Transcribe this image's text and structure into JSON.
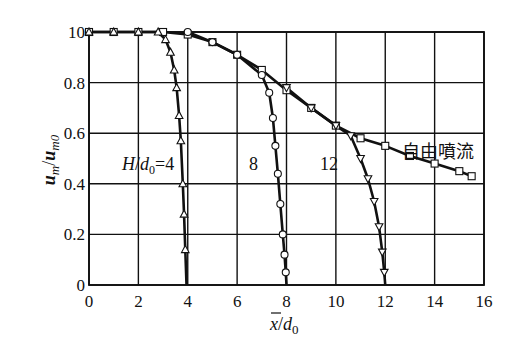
{
  "chart_data": {
    "type": "line",
    "title": "",
    "xlabel": "x̄/d0",
    "ylabel": "um/um0",
    "xlim": [
      0,
      16
    ],
    "ylim": [
      0,
      1.0
    ],
    "grid": true,
    "x_ticks": [
      "0",
      "2",
      "4",
      "6",
      "8",
      "10",
      "12",
      "14",
      "16"
    ],
    "y_ticks": [
      "0",
      "0.2",
      "0.4",
      "0.6",
      "0.8",
      "10"
    ],
    "series": [
      {
        "name": "自由噴流",
        "marker": "square",
        "x": [
          0,
          1,
          2,
          3,
          4,
          5,
          6,
          7,
          8,
          9,
          10,
          11,
          12,
          13,
          14,
          15,
          15.5
        ],
        "y": [
          1.0,
          1.0,
          1.0,
          1.0,
          0.99,
          0.96,
          0.91,
          0.85,
          0.77,
          0.7,
          0.63,
          0.58,
          0.55,
          0.51,
          0.48,
          0.45,
          0.43
        ]
      },
      {
        "name": "H/d0=4",
        "marker": "triangle-up",
        "x": [
          0,
          1,
          2,
          2.8,
          3.1,
          3.3,
          3.45,
          3.55,
          3.65,
          3.72,
          3.8,
          3.85,
          3.9,
          3.95
        ],
        "y": [
          1.0,
          1.0,
          1.0,
          1.0,
          0.97,
          0.92,
          0.85,
          0.78,
          0.67,
          0.57,
          0.4,
          0.28,
          0.14,
          0.0
        ]
      },
      {
        "name": "H/d0=8",
        "marker": "circle",
        "x": [
          4,
          5,
          6,
          7,
          7.3,
          7.45,
          7.55,
          7.65,
          7.75,
          7.85,
          7.92,
          7.97,
          8.0
        ],
        "y": [
          1.0,
          0.96,
          0.91,
          0.83,
          0.76,
          0.66,
          0.55,
          0.44,
          0.32,
          0.2,
          0.12,
          0.05,
          0.0
        ]
      },
      {
        "name": "H/d0=12",
        "marker": "triangle-down",
        "x": [
          8,
          9,
          10,
          10.6,
          11.0,
          11.3,
          11.55,
          11.75,
          11.88,
          11.96,
          12.0
        ],
        "y": [
          0.78,
          0.7,
          0.63,
          0.59,
          0.5,
          0.42,
          0.33,
          0.23,
          0.13,
          0.05,
          0.0
        ]
      }
    ],
    "annotations": [
      {
        "text": "H/d0=4",
        "x": 1.4,
        "y": 0.48
      },
      {
        "text": "8",
        "x": 6.3,
        "y": 0.48
      },
      {
        "text": "12",
        "x": 9.3,
        "y": 0.48
      },
      {
        "text": "自由噴流",
        "x": 12.6,
        "y": 0.53
      }
    ]
  },
  "labels": {
    "y_axis_main": "u",
    "y_axis_main_sub": "m",
    "y_axis_slash": "/",
    "y_axis_den": "u",
    "y_axis_den_sub": "m0",
    "x_axis_main": "x",
    "x_axis_slash": "/",
    "x_axis_den": "d",
    "x_axis_den_sub": "0",
    "ann_h": "H",
    "ann_slash": "/",
    "ann_d": "d",
    "ann_sub": "0",
    "ann_eq4": "=4",
    "ann_8": "8",
    "ann_12": "12",
    "ann_free": "自由噴流"
  }
}
